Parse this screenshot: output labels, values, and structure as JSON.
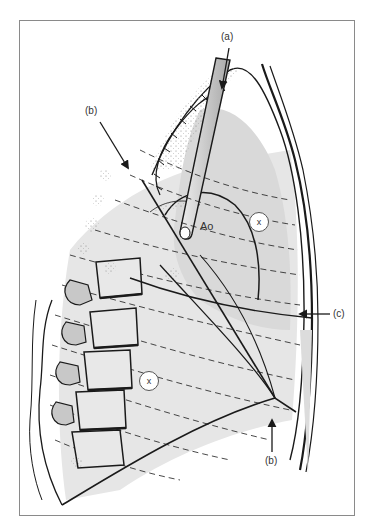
{
  "figure": {
    "colors": {
      "frame": "#8a8a8a",
      "ink": "#1a1a1a",
      "shade": "#dcdcdc",
      "shade_light": "#ececec",
      "tube": "#bdbdbd"
    }
  },
  "labels": {
    "a": "(a)",
    "b_top": "(b)",
    "c": "(c)",
    "b_bottom": "(b)",
    "aorta": "Ao",
    "x_upper": "x",
    "x_lower": "x"
  }
}
